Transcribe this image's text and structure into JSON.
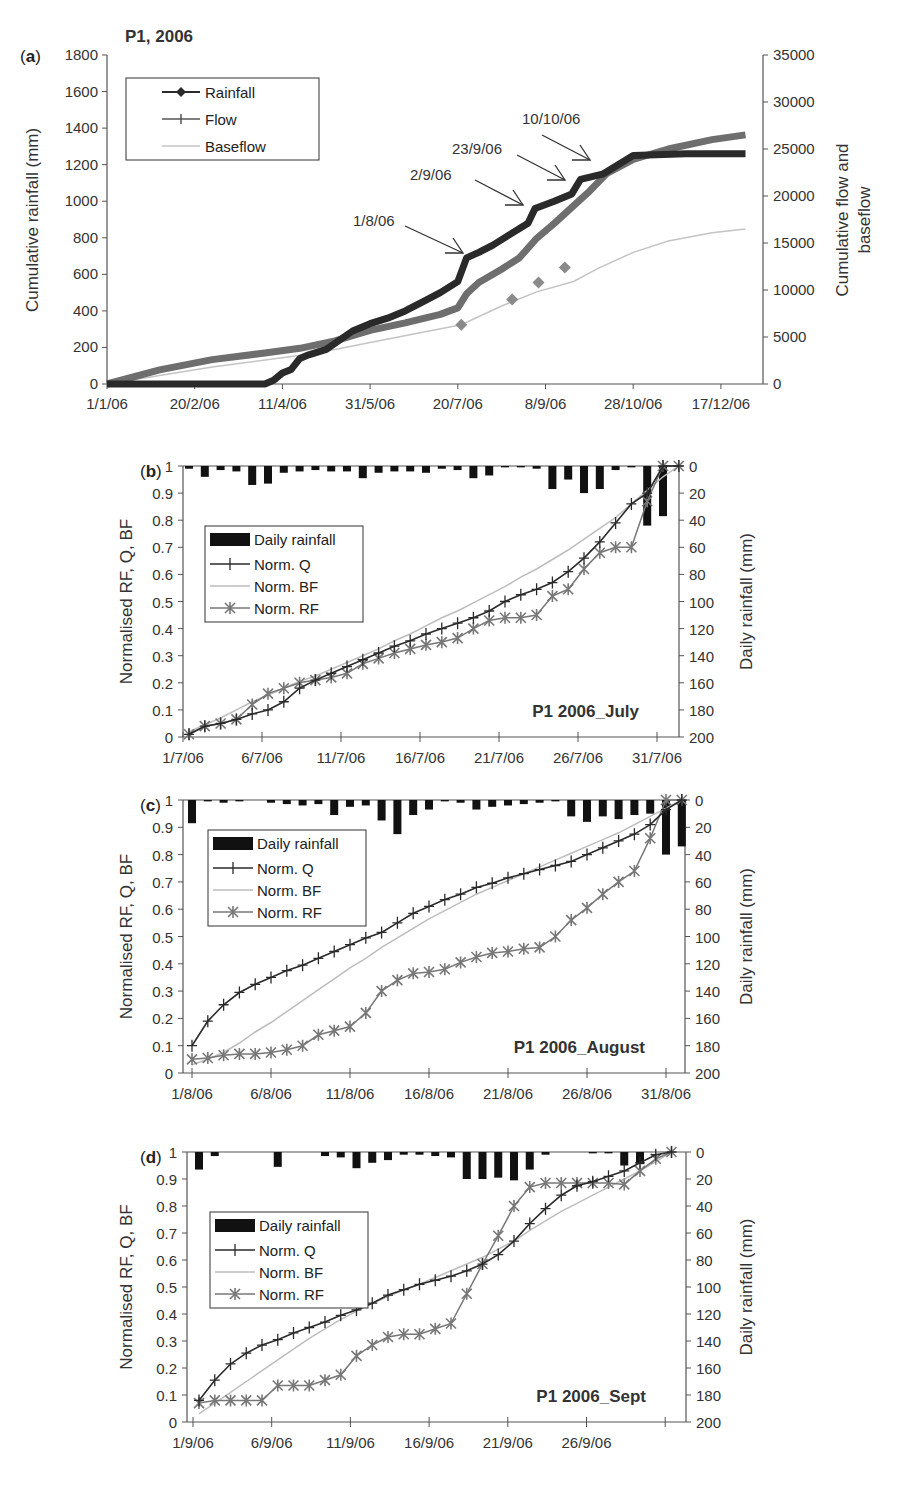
{
  "figure": {
    "colors": {
      "rainfall": "#2a2a2a",
      "flow": "#6e6e6e",
      "baseflow": "#c4c4c4",
      "diamond_marker": "#8a8a8a",
      "norm_q": "#2a2a2a",
      "norm_bf": "#bdbdbd",
      "norm_rf": "#777777",
      "bars": "#111111",
      "axis": "#555555"
    }
  },
  "chart_data": [
    {
      "id": "a",
      "panel_label": "(a)",
      "type": "line",
      "title": "P1, 2006",
      "xlabel": "",
      "ylabel": "Cumulative rainfall (mm)",
      "y2label": "Cumulative flow and baseflow",
      "ylim": [
        0,
        1800
      ],
      "y2lim": [
        0,
        35000
      ],
      "yticks": [
        "0",
        "200",
        "400",
        "600",
        "800",
        "1000",
        "1200",
        "1400",
        "1600",
        "1800"
      ],
      "y2ticks": [
        "0",
        "5000",
        "10000",
        "15000",
        "20000",
        "25000",
        "30000",
        "35000"
      ],
      "xticks": [
        "1/1/06",
        "20/2/06",
        "11/4/06",
        "31/5/06",
        "20/7/06",
        "8/9/06",
        "28/10/06",
        "17/12/06"
      ],
      "legend": [
        "Rainfall",
        "Flow",
        "Baseflow"
      ],
      "legend_position": "upper-left",
      "grid": false,
      "annotations": [
        "1/8/06",
        "2/9/06",
        "23/9/06",
        "10/10/06"
      ],
      "series": [
        {
          "name": "Rainfall",
          "axis": "left",
          "x_day": [
            0,
            50,
            90,
            95,
            100,
            105,
            110,
            115,
            125,
            140,
            150,
            160,
            170,
            180,
            190,
            200,
            205,
            212,
            220,
            230,
            240,
            244,
            255,
            265,
            270,
            283,
            300,
            330,
            364
          ],
          "values": [
            0,
            0,
            0,
            20,
            60,
            80,
            140,
            160,
            190,
            290,
            330,
            360,
            400,
            450,
            500,
            560,
            690,
            720,
            760,
            820,
            880,
            960,
            1000,
            1040,
            1120,
            1150,
            1250,
            1260,
            1260
          ]
        },
        {
          "name": "Flow",
          "axis": "right",
          "x_day": [
            0,
            30,
            60,
            90,
            110,
            130,
            150,
            170,
            190,
            200,
            205,
            212,
            225,
            235,
            245,
            255,
            265,
            275,
            285,
            300,
            320,
            345,
            364
          ],
          "values": [
            0,
            1500,
            2600,
            3300,
            3800,
            4600,
            5700,
            6500,
            7400,
            8100,
            9600,
            10800,
            12200,
            13400,
            15500,
            17100,
            18800,
            20500,
            22400,
            23900,
            25000,
            26000,
            26500
          ]
        },
        {
          "name": "Baseflow",
          "axis": "right",
          "x_day": [
            0,
            60,
            120,
            150,
            180,
            202,
            225,
            245,
            266,
            280,
            300,
            320,
            345,
            364
          ],
          "values": [
            0,
            1800,
            3300,
            4400,
            5500,
            6300,
            8300,
            9800,
            10900,
            12300,
            14000,
            15200,
            16100,
            16500
          ]
        },
        {
          "name": "Baseflow markers",
          "axis": "right",
          "x_day": [
            202,
            231,
            246,
            261
          ],
          "values": [
            6300,
            9000,
            10800,
            12400
          ]
        }
      ]
    },
    {
      "id": "b",
      "panel_label": "(b)",
      "type": "line",
      "title": "P1 2006_July",
      "ylabel": "Normalised RF, Q, BF",
      "y2label": "Daily rainfall (mm)",
      "ylim": [
        0,
        1
      ],
      "y2lim": [
        200,
        0
      ],
      "yticks": [
        "0",
        "0.1",
        "0.2",
        "0.3",
        "0.4",
        "0.5",
        "0.6",
        "0.7",
        "0.8",
        "0.9",
        "1"
      ],
      "y2ticks": [
        "0",
        "20",
        "40",
        "60",
        "80",
        "100",
        "120",
        "140",
        "160",
        "180",
        "200"
      ],
      "xticks": [
        "1/7/06",
        "6/7/06",
        "11/7/06",
        "16/7/06",
        "21/7/06",
        "26/7/06",
        "31/7/06"
      ],
      "legend": [
        "Daily rainfall",
        "Norm. Q",
        "Norm. BF",
        "Norm. RF"
      ],
      "legend_position": "middle-left",
      "grid": false,
      "days": [
        1,
        2,
        3,
        4,
        5,
        6,
        7,
        8,
        9,
        10,
        11,
        12,
        13,
        14,
        15,
        16,
        17,
        18,
        19,
        20,
        21,
        22,
        23,
        24,
        25,
        26,
        27,
        28,
        29,
        30,
        31,
        32
      ],
      "series": [
        {
          "name": "Daily rainfall",
          "type": "bar",
          "values": [
            2,
            8,
            3,
            4,
            14,
            13,
            5,
            4,
            3,
            4,
            4,
            9,
            5,
            4,
            4,
            5,
            2,
            3,
            9,
            7,
            1,
            1,
            2,
            17,
            10,
            20,
            17,
            3,
            1,
            44,
            37,
            0
          ]
        },
        {
          "name": "Norm. Q",
          "values": [
            0.01,
            0.04,
            0.05,
            0.065,
            0.085,
            0.1,
            0.13,
            0.18,
            0.21,
            0.235,
            0.26,
            0.285,
            0.31,
            0.335,
            0.355,
            0.38,
            0.4,
            0.42,
            0.44,
            0.465,
            0.5,
            0.525,
            0.545,
            0.57,
            0.61,
            0.66,
            0.72,
            0.79,
            0.86,
            0.9,
            1.0,
            1.0
          ]
        },
        {
          "name": "Norm. BF",
          "values": [
            0.02,
            0.045,
            0.07,
            0.1,
            0.13,
            0.155,
            0.18,
            0.205,
            0.225,
            0.25,
            0.275,
            0.3,
            0.325,
            0.355,
            0.38,
            0.41,
            0.44,
            0.465,
            0.495,
            0.525,
            0.555,
            0.59,
            0.62,
            0.655,
            0.69,
            0.73,
            0.77,
            0.81,
            0.86,
            0.91,
            0.96,
            1.0
          ]
        },
        {
          "name": "Norm. RF",
          "values": [
            0.01,
            0.04,
            0.05,
            0.065,
            0.12,
            0.16,
            0.18,
            0.2,
            0.21,
            0.22,
            0.235,
            0.27,
            0.29,
            0.31,
            0.325,
            0.34,
            0.35,
            0.365,
            0.4,
            0.43,
            0.44,
            0.44,
            0.45,
            0.52,
            0.545,
            0.62,
            0.68,
            0.7,
            0.7,
            0.87,
            1.0,
            1.0
          ]
        }
      ]
    },
    {
      "id": "c",
      "panel_label": "(c)",
      "type": "line",
      "title": "P1 2006_August",
      "ylabel": "Normalised RF, Q, BF",
      "y2label": "Daily rainfall (mm)",
      "ylim": [
        0,
        1
      ],
      "y2lim": [
        200,
        0
      ],
      "yticks": [
        "0",
        "0.1",
        "0.2",
        "0.3",
        "0.4",
        "0.5",
        "0.6",
        "0.7",
        "0.8",
        "0.9",
        "1"
      ],
      "y2ticks": [
        "0",
        "20",
        "40",
        "60",
        "80",
        "100",
        "120",
        "140",
        "160",
        "180",
        "200"
      ],
      "xticks": [
        "1/8/06",
        "6/8/06",
        "11/8/06",
        "16/8/06",
        "21/8/06",
        "26/8/06",
        "31/8/06"
      ],
      "legend": [
        "Daily rainfall",
        "Norm. Q",
        "Norm. BF",
        "Norm. RF"
      ],
      "legend_position": "upper-left",
      "grid": false,
      "days": [
        1,
        2,
        3,
        4,
        5,
        6,
        7,
        8,
        9,
        10,
        11,
        12,
        13,
        14,
        15,
        16,
        17,
        18,
        19,
        20,
        21,
        22,
        23,
        24,
        25,
        26,
        27,
        28,
        29,
        30,
        31,
        32
      ],
      "series": [
        {
          "name": "Daily rainfall",
          "type": "bar",
          "values": [
            17,
            1,
            2,
            1,
            0,
            2,
            3,
            4,
            3,
            11,
            5,
            4,
            15,
            25,
            11,
            7,
            1,
            2,
            7,
            5,
            4,
            3,
            2,
            1,
            12,
            16,
            12,
            14,
            11,
            10,
            40,
            34
          ]
        },
        {
          "name": "Norm. Q",
          "values": [
            0.1,
            0.19,
            0.25,
            0.295,
            0.325,
            0.35,
            0.375,
            0.395,
            0.42,
            0.445,
            0.47,
            0.495,
            0.515,
            0.55,
            0.585,
            0.61,
            0.635,
            0.655,
            0.68,
            0.695,
            0.715,
            0.73,
            0.745,
            0.76,
            0.775,
            0.8,
            0.825,
            0.85,
            0.875,
            0.91,
            0.965,
            1.0
          ]
        },
        {
          "name": "Norm. BF",
          "values": [
            0.03,
            0.05,
            0.075,
            0.11,
            0.15,
            0.185,
            0.225,
            0.265,
            0.305,
            0.345,
            0.385,
            0.42,
            0.46,
            0.495,
            0.53,
            0.565,
            0.595,
            0.625,
            0.655,
            0.68,
            0.705,
            0.73,
            0.755,
            0.78,
            0.805,
            0.83,
            0.855,
            0.88,
            0.91,
            0.94,
            0.97,
            1.0
          ]
        },
        {
          "name": "Norm. RF",
          "values": [
            0.05,
            0.055,
            0.065,
            0.07,
            0.07,
            0.075,
            0.085,
            0.1,
            0.14,
            0.155,
            0.17,
            0.22,
            0.3,
            0.34,
            0.365,
            0.37,
            0.38,
            0.405,
            0.425,
            0.44,
            0.445,
            0.455,
            0.46,
            0.5,
            0.56,
            0.605,
            0.655,
            0.7,
            0.74,
            0.86,
            1.0,
            1.0
          ]
        }
      ]
    },
    {
      "id": "d",
      "panel_label": "(d)",
      "type": "line",
      "title": "P1 2006_Sept",
      "ylabel": "Normalised RF, Q, BF",
      "y2label": "Daily rainfall (mm)",
      "ylim": [
        0,
        1
      ],
      "y2lim": [
        200,
        0
      ],
      "yticks": [
        "0",
        "0.1",
        "0.2",
        "0.3",
        "0.4",
        "0.5",
        "0.6",
        "0.7",
        "0.8",
        "0.9",
        "1"
      ],
      "y2ticks": [
        "0",
        "20",
        "40",
        "60",
        "80",
        "100",
        "120",
        "140",
        "160",
        "180",
        "200"
      ],
      "xticks": [
        "1/9/06",
        "6/9/06",
        "11/9/06",
        "16/9/06",
        "21/9/06",
        "26/9/06",
        ""
      ],
      "legend": [
        "Daily rainfall",
        "Norm. Q",
        "Norm. BF",
        "Norm. RF"
      ],
      "legend_position": "middle-left",
      "grid": false,
      "days": [
        1,
        2,
        3,
        4,
        5,
        6,
        7,
        8,
        9,
        10,
        11,
        12,
        13,
        14,
        15,
        16,
        17,
        18,
        19,
        20,
        21,
        22,
        23,
        24,
        25,
        26,
        27,
        28,
        29,
        30,
        31
      ],
      "series": [
        {
          "name": "Daily rainfall",
          "type": "bar",
          "values": [
            13,
            3,
            0,
            0,
            0,
            11,
            0,
            0,
            3,
            4,
            12,
            8,
            6,
            2,
            2,
            3,
            4,
            20,
            20,
            19,
            21,
            13,
            2,
            0,
            0,
            1,
            1,
            10,
            9,
            0,
            0
          ]
        },
        {
          "name": "Norm. Q",
          "values": [
            0.08,
            0.155,
            0.215,
            0.255,
            0.285,
            0.305,
            0.33,
            0.35,
            0.37,
            0.395,
            0.415,
            0.44,
            0.47,
            0.49,
            0.51,
            0.525,
            0.54,
            0.56,
            0.585,
            0.62,
            0.67,
            0.735,
            0.79,
            0.84,
            0.875,
            0.89,
            0.91,
            0.93,
            0.96,
            0.99,
            1.0
          ]
        },
        {
          "name": "Norm. BF",
          "values": [
            0.03,
            0.07,
            0.11,
            0.15,
            0.19,
            0.23,
            0.27,
            0.31,
            0.345,
            0.38,
            0.41,
            0.44,
            0.465,
            0.49,
            0.51,
            0.535,
            0.56,
            0.585,
            0.61,
            0.64,
            0.67,
            0.71,
            0.745,
            0.78,
            0.81,
            0.84,
            0.87,
            0.9,
            0.93,
            0.965,
            1.0
          ]
        },
        {
          "name": "Norm. RF",
          "values": [
            0.07,
            0.08,
            0.08,
            0.08,
            0.08,
            0.135,
            0.135,
            0.135,
            0.155,
            0.175,
            0.245,
            0.285,
            0.315,
            0.325,
            0.325,
            0.345,
            0.365,
            0.475,
            0.585,
            0.69,
            0.8,
            0.87,
            0.885,
            0.885,
            0.885,
            0.885,
            0.885,
            0.88,
            0.93,
            0.975,
            1.0
          ]
        }
      ]
    }
  ]
}
